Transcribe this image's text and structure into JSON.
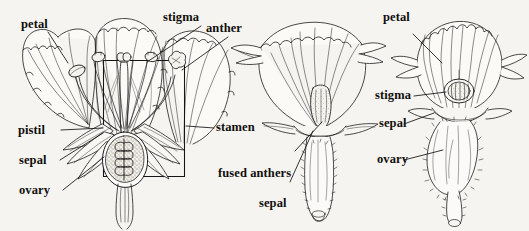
{
  "figure": {
    "background_color": "#f6f4f0",
    "ink_color": "#1a1a1a",
    "width": 529,
    "height": 231,
    "panel_count": 3
  },
  "labels": {
    "petal_left": "petal",
    "stigma_left": "stigma",
    "anther_left": "anther",
    "pistil_left": "pistil",
    "sepal_left": "sepal",
    "ovary_left": "ovary",
    "stamen_left": "stamen",
    "fused_anthers_center": "fused anthers",
    "sepal_center": "sepal",
    "petal_right": "petal",
    "stigma_right": "stigma",
    "sepal_right": "sepal",
    "ovary_right": "ovary"
  },
  "panels": [
    {
      "name": "longitudinal-section",
      "parts": [
        "petal",
        "stigma",
        "anther",
        "pistil",
        "sepal",
        "ovary",
        "stamen"
      ],
      "has_inset_box": true
    },
    {
      "name": "side-view-flower",
      "parts": [
        "fused anthers",
        "sepal"
      ],
      "has_inset_box": false
    },
    {
      "name": "front-view-flower",
      "parts": [
        "petal",
        "stigma",
        "sepal",
        "ovary"
      ],
      "has_inset_box": false
    }
  ]
}
